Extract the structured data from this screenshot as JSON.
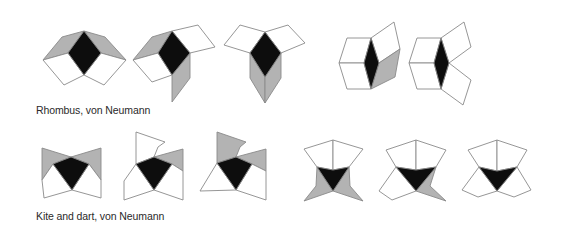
{
  "colors": {
    "center": "#0d0d0d",
    "shaded": "#b3b3b3",
    "empty": "#ffffff",
    "outline": "#8a8a8a"
  },
  "rows": [
    {
      "id": "rhombus",
      "caption": "Rhombus, von Neumann",
      "tile_shape": "rhombus",
      "neighborhood": "von Neumann",
      "configurations": [
        {
          "center": "center",
          "neighbors": [
            "shaded",
            "shaded",
            "empty",
            "empty"
          ]
        },
        {
          "center": "center",
          "neighbors": [
            "shaded",
            "empty",
            "shaded",
            "empty"
          ]
        },
        {
          "center": "center",
          "neighbors": [
            "empty",
            "empty",
            "shaded",
            "shaded"
          ]
        },
        {
          "center": "center",
          "neighbors": [
            "empty",
            "empty",
            "empty",
            "shaded"
          ]
        },
        {
          "center": "center",
          "neighbors": [
            "empty",
            "empty",
            "empty",
            "empty"
          ]
        }
      ]
    },
    {
      "id": "kite-dart",
      "caption": "Kite and dart, von Neumann",
      "tile_shape": "kite and dart",
      "neighborhood": "von Neumann",
      "configurations": [
        {
          "center": "center",
          "neighbors": [
            "shaded",
            "shaded",
            "empty",
            "empty"
          ]
        },
        {
          "center": "center",
          "neighbors": [
            "empty",
            "shaded",
            "empty",
            "empty"
          ]
        },
        {
          "center": "center",
          "neighbors": [
            "shaded",
            "shaded",
            "empty",
            "empty"
          ]
        },
        {
          "center": "center",
          "neighbors": [
            "empty",
            "empty",
            "shaded",
            "shaded"
          ]
        },
        {
          "center": "center",
          "neighbors": [
            "empty",
            "empty",
            "empty",
            "shaded"
          ]
        },
        {
          "center": "center",
          "neighbors": [
            "empty",
            "empty",
            "empty",
            "empty"
          ]
        }
      ]
    }
  ]
}
